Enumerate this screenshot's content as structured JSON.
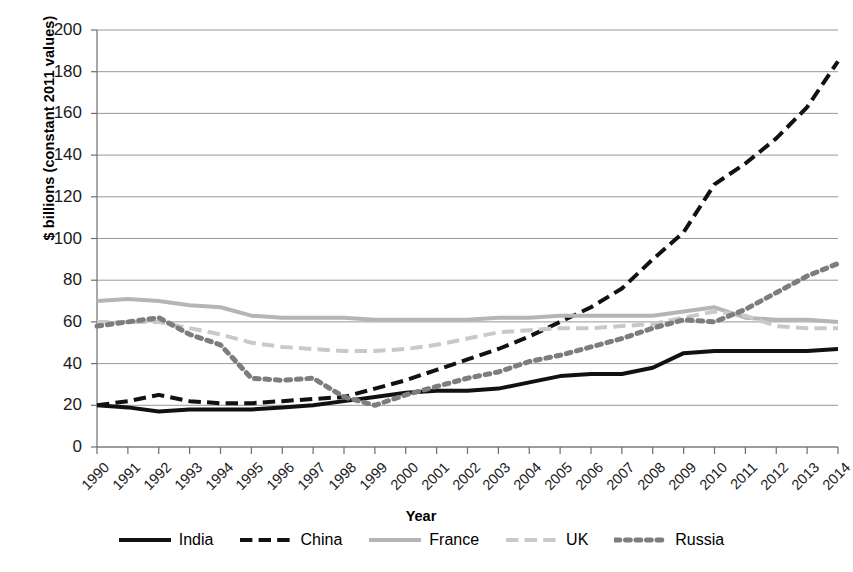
{
  "chart_data": {
    "type": "line",
    "title": "",
    "xlabel": "Year",
    "ylabel": "$ billions (constant 2011 values)",
    "ylim": [
      0,
      200
    ],
    "ytick_step": 20,
    "yticks": [
      "200",
      "180",
      "160",
      "140",
      "120",
      "100",
      "80",
      "60",
      "40",
      "20",
      "0"
    ],
    "grid": true,
    "legend_position": "bottom",
    "categories": [
      "1990",
      "1991",
      "1992",
      "1993",
      "1994",
      "1995",
      "1996",
      "1997",
      "1998",
      "1999",
      "2000",
      "2001",
      "2002",
      "2003",
      "2004",
      "2005",
      "2006",
      "2007",
      "2008",
      "2009",
      "2010",
      "2011",
      "2012",
      "2013",
      "2014"
    ],
    "series": [
      {
        "name": "India",
        "color": "#111111",
        "style": "solid",
        "width": 4,
        "values": [
          20,
          19,
          17,
          18,
          18,
          18,
          19,
          20,
          22,
          24,
          26,
          27,
          27,
          28,
          31,
          34,
          35,
          35,
          38,
          45,
          46,
          46,
          46,
          46,
          47
        ]
      },
      {
        "name": "China",
        "color": "#111111",
        "style": "dashed",
        "width": 4,
        "values": [
          20,
          22,
          25,
          22,
          21,
          21,
          22,
          23,
          24,
          28,
          32,
          37,
          42,
          47,
          53,
          60,
          67,
          76,
          90,
          103,
          126,
          136,
          148,
          163,
          185
        ]
      },
      {
        "name": "France",
        "color": "#b5b5b5",
        "style": "solid",
        "width": 4,
        "values": [
          70,
          71,
          70,
          68,
          67,
          63,
          62,
          62,
          62,
          61,
          61,
          61,
          61,
          62,
          62,
          63,
          63,
          63,
          63,
          65,
          67,
          62,
          61,
          61,
          60
        ]
      },
      {
        "name": "UK",
        "color": "#c9c9c9",
        "style": "dashed",
        "width": 4,
        "values": [
          60,
          60,
          60,
          57,
          54,
          50,
          48,
          47,
          46,
          46,
          47,
          49,
          52,
          55,
          56,
          57,
          57,
          58,
          59,
          62,
          65,
          63,
          58,
          57,
          57
        ]
      },
      {
        "name": "Russia",
        "color": "#7d7d7d",
        "style": "dotted",
        "width": 5,
        "values": [
          58,
          60,
          62,
          54,
          49,
          33,
          32,
          33,
          24,
          20,
          25,
          29,
          33,
          36,
          41,
          44,
          48,
          52,
          57,
          61,
          60,
          66,
          74,
          82,
          88
        ]
      }
    ]
  },
  "legend": {
    "items": [
      {
        "label": "India"
      },
      {
        "label": "China"
      },
      {
        "label": "France"
      },
      {
        "label": "UK"
      },
      {
        "label": "Russia"
      }
    ]
  }
}
